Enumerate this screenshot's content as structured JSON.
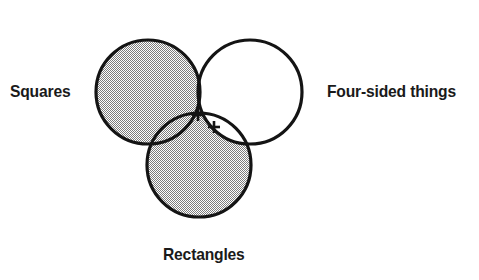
{
  "diagram": {
    "type": "venn-diagram",
    "set_count": 3,
    "title": "",
    "background_color": "#ffffff",
    "stroke_color": "#141414",
    "shade_color": "#b9b9b9",
    "white_fill": "#ffffff",
    "labels": {
      "left": "Squares",
      "right": "Four-sided things",
      "bottom": "Rectangles"
    },
    "circles": [
      {
        "name": "squares",
        "cx": 148,
        "cy": 92,
        "r": 52,
        "label": "Squares",
        "fill": "shaded"
      },
      {
        "name": "four-sided-things",
        "cx": 250,
        "cy": 92,
        "r": 52,
        "label": "Four-sided things",
        "fill": "white"
      },
      {
        "name": "rectangles",
        "cx": 199,
        "cy": 165,
        "r": 52,
        "label": "Rectangles",
        "fill": "shaded"
      }
    ],
    "regions": [
      {
        "name": "squares-only",
        "shaded": true
      },
      {
        "name": "four-sided-only",
        "shaded": false
      },
      {
        "name": "rectangles-only",
        "shaded": true
      },
      {
        "name": "squares-and-four-sided",
        "shaded": true
      },
      {
        "name": "squares-and-rectangles",
        "shaded": true
      },
      {
        "name": "rectangles-and-four-sided",
        "shaded": false
      },
      {
        "name": "all-three",
        "shaded": false
      }
    ],
    "markers": [
      {
        "name": "plus-marker-1",
        "glyph": "+",
        "x": 198,
        "y": 115
      },
      {
        "name": "plus-marker-2",
        "glyph": "+",
        "x": 214,
        "y": 127
      }
    ],
    "top_artifacts": [
      {
        "x": 40
      },
      {
        "x": 209
      }
    ]
  }
}
